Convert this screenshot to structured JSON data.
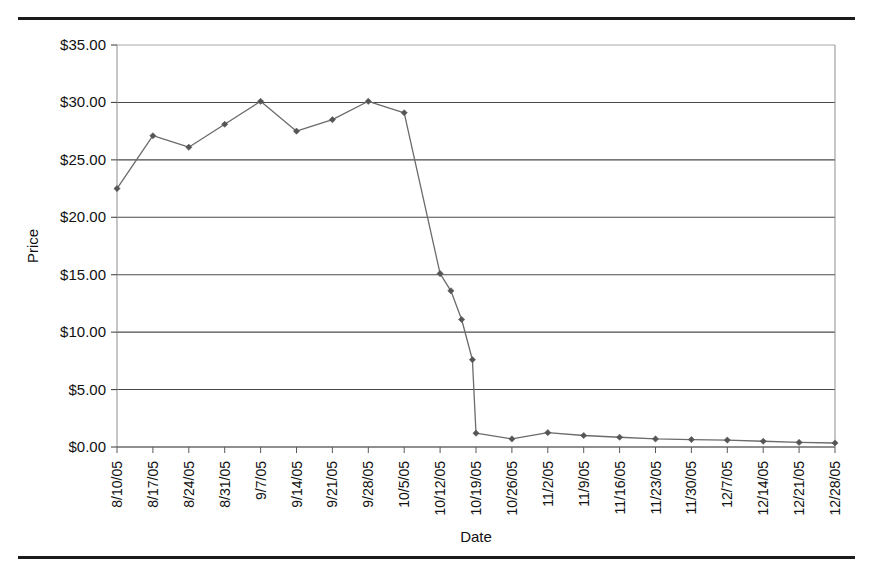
{
  "page": {
    "top_rule": true,
    "bottom_rule": true
  },
  "chart_data": {
    "type": "line",
    "title": "",
    "xlabel": "Date",
    "ylabel": "Price",
    "ylim": [
      0,
      35
    ],
    "ytick_step": 5,
    "grid": "horizontal",
    "legend": "none",
    "marker": "diamond",
    "line_color": "#6b6b6b",
    "marker_color": "#555555",
    "ytick_labels": [
      "$0.00",
      "$5.00",
      "$10.00",
      "$15.00",
      "$20.00",
      "$25.00",
      "$30.00",
      "$35.00"
    ],
    "ytick_values": [
      0,
      5,
      10,
      15,
      20,
      25,
      30,
      35
    ],
    "categories": [
      "8/10/05",
      "8/17/05",
      "8/24/05",
      "8/31/05",
      "9/7/05",
      "9/14/05",
      "9/21/05",
      "9/28/05",
      "10/5/05",
      "10/12/05",
      "10/19/05",
      "10/26/05",
      "11/2/05",
      "11/9/05",
      "11/16/05",
      "11/23/05",
      "11/30/05",
      "12/7/05",
      "12/14/05",
      "12/21/05",
      "12/28/05"
    ],
    "values": [
      22.5,
      27.1,
      26.1,
      28.1,
      30.1,
      27.5,
      28.5,
      30.1,
      29.1,
      15.1,
      1.2,
      0.7,
      1.25,
      1.0,
      0.85,
      0.7,
      0.65,
      0.6,
      0.5,
      0.4,
      0.35
    ],
    "intermediate_points": {
      "note": "Extra plotted samples on the crash segment between 10/12/05 and 10/19/05",
      "x_fraction_values": [
        {
          "x": 9.3,
          "y": 13.6
        },
        {
          "x": 9.6,
          "y": 11.1
        },
        {
          "x": 9.9,
          "y": 7.6
        }
      ]
    }
  },
  "axes": {
    "x_title": "Date",
    "y_title": "Price"
  }
}
